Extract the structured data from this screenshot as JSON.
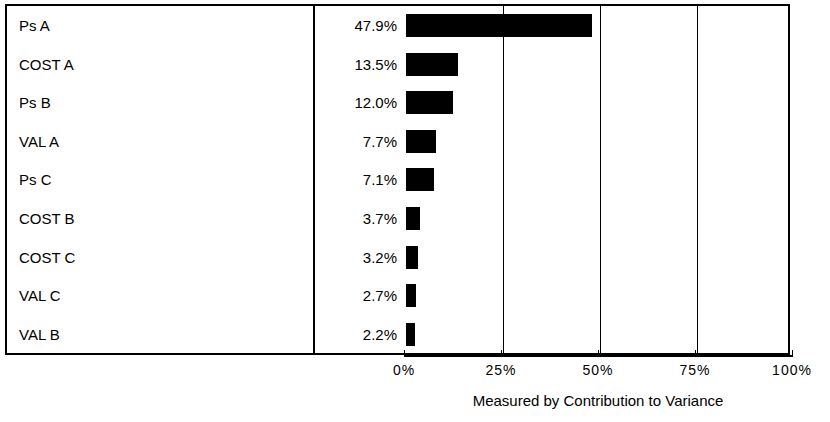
{
  "chart_data": {
    "type": "bar",
    "orientation": "horizontal",
    "title": "",
    "xlabel": "Measured by Contribution to Variance",
    "ylabel": "",
    "xlim": [
      0,
      100
    ],
    "x_tick_labels": [
      "0%",
      "25%",
      "50%",
      "75%",
      "100%"
    ],
    "x_ticks": [
      0,
      25,
      50,
      75,
      100
    ],
    "x_unit": "%",
    "grid": true,
    "gridlines_at": [
      25,
      50,
      75
    ],
    "legend": "none",
    "bar_color": "#000000",
    "categories": [
      "Ps A",
      "COST A",
      "Ps B",
      "VAL A",
      "Ps C",
      "COST B",
      "COST C",
      "VAL C",
      "VAL B"
    ],
    "values": [
      47.9,
      13.5,
      12.0,
      7.7,
      7.1,
      3.7,
      3.2,
      2.7,
      2.2
    ],
    "value_labels": [
      "47.9%",
      "13.5%",
      "12.0%",
      "7.7%",
      "7.1%",
      "3.7%",
      "3.2%",
      "2.7%",
      "2.2%"
    ],
    "rows": [
      {
        "label": "Ps A",
        "value": 47.9,
        "value_label": "47.9%"
      },
      {
        "label": "COST A",
        "value": 13.5,
        "value_label": "13.5%"
      },
      {
        "label": "Ps B",
        "value": 12.0,
        "value_label": "12.0%"
      },
      {
        "label": "VAL A",
        "value": 7.7,
        "value_label": "7.7%"
      },
      {
        "label": "Ps C",
        "value": 7.1,
        "value_label": "7.1%"
      },
      {
        "label": "COST B",
        "value": 3.7,
        "value_label": "3.7%"
      },
      {
        "label": "COST C",
        "value": 3.2,
        "value_label": "3.2%"
      },
      {
        "label": "VAL C",
        "value": 2.7,
        "value_label": "2.7%"
      },
      {
        "label": "VAL B",
        "value": 2.2,
        "value_label": "2.2%"
      }
    ]
  },
  "axis": {
    "caption": "Measured by Contribution to Variance",
    "ticks": [
      {
        "label": "0%",
        "value": 0
      },
      {
        "label": "25%",
        "value": 25
      },
      {
        "label": "50%",
        "value": 50
      },
      {
        "label": "75%",
        "value": 75
      },
      {
        "label": "100%",
        "value": 100
      }
    ]
  },
  "colors": {
    "bar": "#000000",
    "frame": "#000000",
    "background": "#ffffff",
    "text": "#000000"
  }
}
